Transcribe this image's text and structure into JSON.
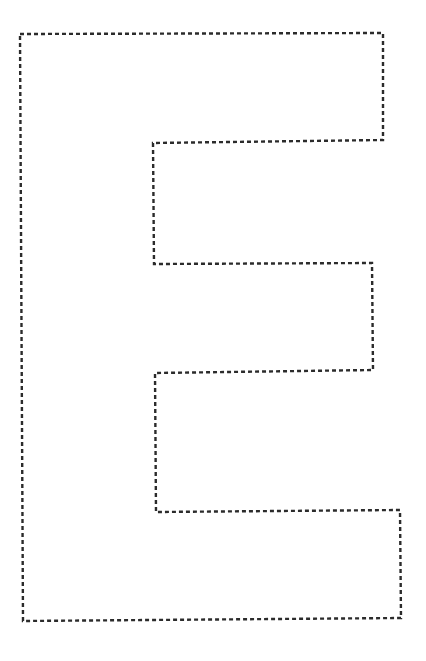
{
  "worksheet": {
    "letter": "E",
    "style": "dotted-outline-tracing",
    "colors": {
      "background": "#ffffff",
      "stroke": "#2b2b2b"
    },
    "outline_points": [
      [
        20,
        34
      ],
      [
        383,
        33
      ],
      [
        383,
        140
      ],
      [
        153,
        143
      ],
      [
        154,
        264
      ],
      [
        372,
        263
      ],
      [
        373,
        370
      ],
      [
        155,
        373
      ],
      [
        156,
        512
      ],
      [
        400,
        510
      ],
      [
        401,
        618
      ],
      [
        23,
        621
      ]
    ]
  }
}
